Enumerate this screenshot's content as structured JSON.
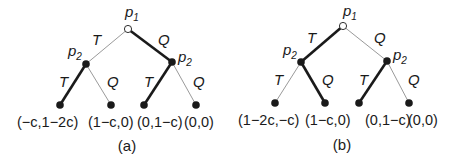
{
  "diagrams": [
    {
      "caption": "(a)",
      "root": {
        "player": "p",
        "sub": "1"
      },
      "branches": {
        "root_left": {
          "label": "T",
          "thick": false
        },
        "root_right": {
          "label": "Q",
          "thick": true
        },
        "left_left": {
          "label": "T",
          "thick": true
        },
        "left_right": {
          "label": "Q",
          "thick": false
        },
        "right_left": {
          "label": "T",
          "thick": true
        },
        "right_right": {
          "label": "Q",
          "thick": false
        }
      },
      "nodes": {
        "left": {
          "player": "p",
          "sub": "2"
        },
        "right": {
          "player": "p",
          "sub": "2"
        }
      },
      "payoffs": [
        "(−c,1−2c)",
        "(1−c,0)",
        "(0,1−c)",
        "(0,0)"
      ]
    },
    {
      "caption": "(b)",
      "root": {
        "player": "p",
        "sub": "1"
      },
      "branches": {
        "root_left": {
          "label": "T",
          "thick": true
        },
        "root_right": {
          "label": "Q",
          "thick": false
        },
        "left_left": {
          "label": "T",
          "thick": false
        },
        "left_right": {
          "label": "Q",
          "thick": true
        },
        "right_left": {
          "label": "T",
          "thick": true
        },
        "right_right": {
          "label": "Q",
          "thick": false
        }
      },
      "nodes": {
        "left": {
          "player": "p",
          "sub": "2"
        },
        "right": {
          "player": "p",
          "sub": "2"
        }
      },
      "payoffs": [
        "(1−2c,−c)",
        "(1−c,0)",
        "(0,1−c)",
        "(0,0)"
      ]
    }
  ],
  "colors": {
    "thick_edge": "#1a1a1a",
    "thin_edge": "#9a9a9a",
    "node_fill": "#1a1a1a",
    "root_fill": "#ffffff"
  }
}
